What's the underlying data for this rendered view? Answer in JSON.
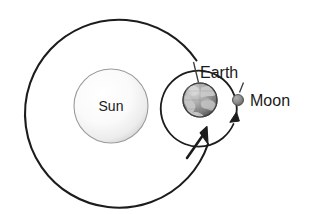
{
  "diagram": {
    "background_color": "#ffffff",
    "bodies": [
      {
        "id": "sun",
        "label": "Sun",
        "cx": 111,
        "cy": 106,
        "r": 37,
        "fill_center": "#ffffff",
        "fill_edge": "#d8d8d8",
        "stroke": "#8c8c8c",
        "label_x": 111,
        "label_y": 111
      },
      {
        "id": "earth",
        "label": "Earth",
        "cx": 200,
        "cy": 100,
        "r": 17,
        "fill_center": "#e6e6e6",
        "fill_edge": "#6e6e6e",
        "stroke": "#4a4a4a",
        "label_x": 200,
        "label_y": 78
      },
      {
        "id": "moon",
        "label": "Moon",
        "cx": 238,
        "cy": 100,
        "r": 5.5,
        "fill_center": "#9a9a9a",
        "fill_edge": "#5e5e5e",
        "stroke": "#4a4a4a",
        "label_x": 250,
        "label_y": 106
      }
    ],
    "orbits": [
      {
        "id": "earth-orbit-around-sun",
        "center_x": 125,
        "center_y": 102,
        "radius": 94,
        "stroke": "#1c1c1c",
        "stroke_width": 2.1,
        "direction": "counterclockwise"
      },
      {
        "id": "moon-orbit-around-earth",
        "center_x": 200,
        "center_y": 100,
        "radius": 38,
        "stroke": "#1c1c1c",
        "stroke_width": 1.8,
        "direction": "counterclockwise"
      }
    ],
    "arrows": [
      {
        "id": "earth-orbit-direction-arrow",
        "points_toward": "earth",
        "color": "#1c1c1c"
      },
      {
        "id": "moon-orbit-direction-arrow",
        "points_toward": "moon",
        "color": "#1c1c1c"
      }
    ],
    "leaders": [
      {
        "id": "earth-label-leader",
        "from_label": "Earth",
        "to_body": "earth",
        "color": "#3a3a3a"
      },
      {
        "id": "moon-label-leader",
        "from_label": "Moon",
        "to_body": "moon",
        "color": "#3a3a3a"
      }
    ]
  }
}
